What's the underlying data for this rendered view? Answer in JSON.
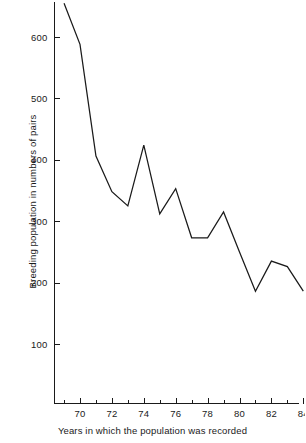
{
  "chart_data": {
    "type": "line",
    "title": "",
    "subtitle": "",
    "xlabel": "Years in which the population was recorded",
    "ylabel": "Breeding population in numbers of pairs",
    "grid": false,
    "legend": false,
    "legend_position": "none",
    "line_color": "#1a1a1a",
    "xlim": [
      1968.6,
      1984.4
    ],
    "ylim": [
      0,
      680
    ],
    "x_tick_labels": [
      "70",
      "72",
      "74",
      "76",
      "78",
      "80",
      "82",
      "84"
    ],
    "x_tick_values": [
      1970,
      1972,
      1974,
      1976,
      1978,
      1980,
      1982,
      1984
    ],
    "x_minor_tick_values": [
      1969,
      1971,
      1973,
      1975,
      1977,
      1979,
      1981,
      1983
    ],
    "y_tick_labels": [
      "100",
      "200",
      "300",
      "400",
      "500",
      "600"
    ],
    "y_tick_values": [
      100,
      200,
      300,
      400,
      500,
      600
    ],
    "x": [
      1969,
      1970,
      1971,
      1972,
      1973,
      1974,
      1975,
      1976,
      1977,
      1978,
      1979,
      1980,
      1981,
      1982,
      1983,
      1984
    ],
    "values": [
      655,
      588,
      406,
      348,
      325,
      424,
      312,
      353,
      273,
      273,
      315,
      250,
      186,
      235,
      226,
      186
    ],
    "series": [
      {
        "name": "Breeding population",
        "values": [
          655,
          588,
          406,
          348,
          325,
          424,
          312,
          353,
          273,
          273,
          315,
          250,
          186,
          235,
          226,
          186
        ]
      }
    ]
  }
}
